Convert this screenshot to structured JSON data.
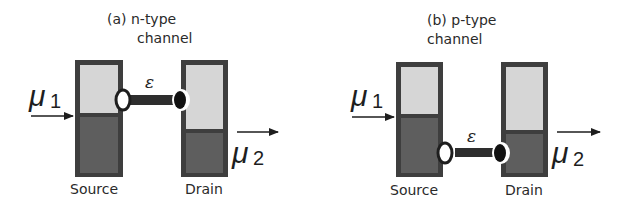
{
  "figure": {
    "panels": [
      {
        "id": "a",
        "title_line1": "(a)  n-type",
        "title_line2": "channel",
        "source_label": "Source",
        "drain_label": "Drain",
        "epsilon_label": "ε",
        "mu1_symbol": "μ",
        "mu1_subscript": "1",
        "mu2_symbol": "μ",
        "mu2_subscript": "2",
        "channel_level": "above source fermi level (between μ1 and μ2 upper states)"
      },
      {
        "id": "b",
        "title_line1": "(b) p-type",
        "title_line2": "channel",
        "source_label": "Source",
        "drain_label": "Drain",
        "epsilon_label": "ε",
        "mu1_symbol": "μ",
        "mu1_subscript": "1",
        "mu2_symbol": "μ",
        "mu2_subscript": "2",
        "channel_level": "below drain fermi level (in filled states)"
      }
    ],
    "colors": {
      "filled": "#5a5a5a",
      "empty": "#d4d4d4",
      "border": "#3a3a3a",
      "text": "#2a2a2a"
    }
  }
}
